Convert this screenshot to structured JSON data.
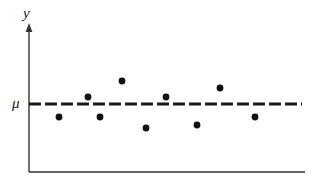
{
  "figure": {
    "background_color": "#ffffff",
    "ink_color": "#1a1a1a",
    "axis_color": "#333333",
    "y_axis_label": "y",
    "mean_label": "μ"
  },
  "chart_data": {
    "type": "scatter",
    "title": "",
    "subtitle": "",
    "xlabel": "",
    "ylabel": "y",
    "grid": false,
    "legend": null,
    "xlim": [
      0,
      10
    ],
    "ylim": [
      0,
      10
    ],
    "axes": {
      "y_axis_arrow": true,
      "x_axis_arrow": false,
      "x_tick_labels": [],
      "y_tick_labels": [
        "μ"
      ]
    },
    "annotations": [
      {
        "name": "mean-reference-line",
        "label": "μ",
        "type": "horizontal-dashed-line",
        "y": 5.0,
        "style": "dashed",
        "dash": 12,
        "gap": 4,
        "thickness": 3,
        "color": "#1a1a1a"
      }
    ],
    "series": [
      {
        "name": "observations",
        "marker": "filled-circle",
        "marker_size": 5,
        "color": "#111111",
        "points": [
          {
            "x": 1.09,
            "y": 4.12,
            "px": 59,
            "py": 117
          },
          {
            "x": 2.14,
            "y": 5.48,
            "px": 88,
            "py": 97
          },
          {
            "x": 2.57,
            "y": 4.12,
            "px": 100,
            "py": 117
          },
          {
            "x": 3.37,
            "y": 6.57,
            "px": 122,
            "py": 81
          },
          {
            "x": 4.24,
            "y": 3.36,
            "px": 146,
            "py": 128
          },
          {
            "x": 4.96,
            "y": 5.48,
            "px": 166,
            "py": 97
          },
          {
            "x": 6.09,
            "y": 3.57,
            "px": 197,
            "py": 125
          },
          {
            "x": 6.91,
            "y": 6.08,
            "px": 220,
            "py": 88
          },
          {
            "x": 8.18,
            "y": 4.12,
            "px": 255,
            "py": 117
          }
        ]
      }
    ],
    "geometry": {
      "y_axis_x": 29,
      "y_axis_top": 24,
      "x_axis_y": 172,
      "x_axis_right": 305,
      "mean_line_y": 104,
      "mean_line_x_start": 29,
      "mean_line_x_end": 302
    }
  }
}
